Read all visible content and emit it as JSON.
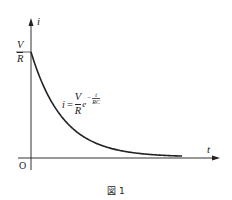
{
  "axes": {
    "y_label": "i",
    "x_label": "t",
    "origin_label": "O"
  },
  "y_intercept": {
    "numerator": "V",
    "denominator": "R"
  },
  "equation": {
    "lhs": "i",
    "equals": "=",
    "numerator": "V",
    "denominator": "R",
    "base": "e",
    "exp_sign": "−",
    "exp_numerator": "t",
    "exp_denominator": "RC"
  },
  "curve": {
    "type": "exponential-decay",
    "formula": "i = (V/R) e^(-t/RC)"
  },
  "caption": "図 1"
}
